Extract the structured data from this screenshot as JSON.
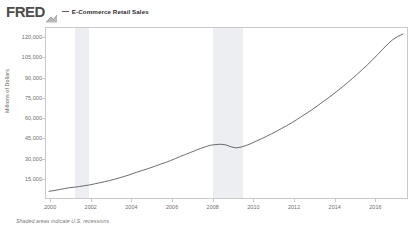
{
  "header": {
    "logo_text": "FRED",
    "logo_glyph_icon": "fred-chart-glyph-icon",
    "legend_marker_icon": "legend-line-dash-icon",
    "series_title": "E-Commerce Retail Sales"
  },
  "footer": {
    "note": "Shaded areas indicate U.S. recessions"
  },
  "colors": {
    "line": "#5b5b5b",
    "recession_band": "#eceef1",
    "frame": "#c9c9c9",
    "tick_text": "#6c6c6c",
    "logo": "#4d4d4d"
  },
  "chart_data": {
    "type": "line",
    "title": "E-Commerce Retail Sales",
    "xlabel": "",
    "ylabel": "Millions of Dollars",
    "grid": false,
    "legend_position": "top",
    "xlim": [
      1999.75,
      2017.6
    ],
    "ylim": [
      0,
      127500
    ],
    "ytick_labels": [
      "120,000",
      "105,000",
      "90,000",
      "75,000",
      "60,000",
      "45,000",
      "30,000",
      "15,000"
    ],
    "ytick_values": [
      120000,
      105000,
      90000,
      75000,
      60000,
      45000,
      30000,
      15000
    ],
    "xtick_labels": [
      "2000",
      "2002",
      "2004",
      "2006",
      "2008",
      "2010",
      "2012",
      "2014",
      "2016"
    ],
    "xtick_values": [
      2000,
      2002,
      2004,
      2006,
      2008,
      2010,
      2012,
      2014,
      2016
    ],
    "series": [
      {
        "name": "E-Commerce Retail Sales",
        "x": [
          1999.9,
          2000.15,
          2000.4,
          2000.65,
          2000.9,
          2001.15,
          2001.4,
          2001.65,
          2001.9,
          2002.15,
          2002.4,
          2002.65,
          2002.9,
          2003.15,
          2003.4,
          2003.65,
          2003.9,
          2004.15,
          2004.4,
          2004.65,
          2004.9,
          2005.15,
          2005.4,
          2005.65,
          2005.9,
          2006.15,
          2006.4,
          2006.65,
          2006.9,
          2007.15,
          2007.4,
          2007.65,
          2007.9,
          2008.15,
          2008.4,
          2008.65,
          2008.9,
          2009.15,
          2009.4,
          2009.65,
          2009.9,
          2010.15,
          2010.4,
          2010.65,
          2010.9,
          2011.15,
          2011.4,
          2011.65,
          2011.9,
          2012.15,
          2012.4,
          2012.65,
          2012.9,
          2013.15,
          2013.4,
          2013.65,
          2013.9,
          2014.15,
          2014.4,
          2014.65,
          2014.9,
          2015.15,
          2015.4,
          2015.65,
          2015.9,
          2016.15,
          2016.4,
          2016.65,
          2016.9,
          2017.15,
          2017.4
        ],
        "y": [
          5000,
          5600,
          6300,
          7000,
          7700,
          8100,
          8600,
          9200,
          9800,
          10600,
          11400,
          12200,
          13100,
          14100,
          15200,
          16300,
          17500,
          18900,
          20100,
          21300,
          22600,
          23900,
          25300,
          26600,
          28000,
          29600,
          31200,
          32700,
          34200,
          35700,
          37200,
          38500,
          39600,
          40100,
          40300,
          39800,
          38400,
          37600,
          38200,
          39400,
          40900,
          42700,
          44400,
          46200,
          48100,
          50100,
          52200,
          54200,
          56400,
          58800,
          61300,
          63700,
          66200,
          68900,
          71700,
          74400,
          77200,
          80200,
          83300,
          86400,
          89600,
          93000,
          96500,
          100000,
          103700,
          107600,
          111600,
          115500,
          118800,
          121200,
          123000
        ]
      }
    ],
    "recessions": [
      {
        "start": 2001.2,
        "end": 2001.85
      },
      {
        "start": 2007.95,
        "end": 2009.45
      }
    ]
  }
}
